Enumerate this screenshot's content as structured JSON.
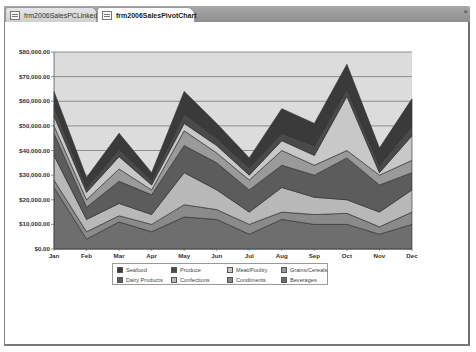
{
  "window": {
    "tabs": [
      {
        "label": "frm2006SalesPCLinked",
        "active": false
      },
      {
        "label": "frm2006SalesPivotChart",
        "active": true
      }
    ],
    "close_label": "×"
  },
  "chart_data": {
    "type": "area",
    "stacked": true,
    "title": "",
    "xlabel": "",
    "ylabel": "",
    "categories": [
      "Jan",
      "Feb",
      "Mar",
      "Apr",
      "May",
      "Jun",
      "Jul",
      "Aug",
      "Sep",
      "Oct",
      "Nov",
      "Dec"
    ],
    "ylim": [
      0,
      80000
    ],
    "yticks": [
      "$80,000.00",
      "$70,000.00",
      "$60,000.00",
      "$50,000.00",
      "$40,000.00",
      "$30,000.00",
      "$20,000.00",
      "$10,000.00",
      "$0.00"
    ],
    "grid": true,
    "legend_position": "bottom",
    "series": [
      {
        "name": "Beverages",
        "color": "#6e6e6e",
        "values": [
          25000,
          4000,
          11000,
          7000,
          13000,
          12000,
          6000,
          12000,
          10000,
          10000,
          6000,
          10000
        ]
      },
      {
        "name": "Condiments",
        "color": "#8a8a8a",
        "values": [
          3000,
          3000,
          2500,
          3000,
          5000,
          4000,
          4000,
          3000,
          4000,
          4500,
          3000,
          5000
        ]
      },
      {
        "name": "Confections",
        "color": "#b8b8b8",
        "values": [
          10000,
          5000,
          5000,
          4000,
          13000,
          8000,
          5000,
          10000,
          7000,
          5500,
          6000,
          9000
        ]
      },
      {
        "name": "Dairy Products",
        "color": "#5c5c5c",
        "values": [
          9000,
          5000,
          9000,
          8000,
          11000,
          11000,
          9000,
          9000,
          9000,
          17000,
          11000,
          7000
        ]
      },
      {
        "name": "Grains/Cereals",
        "color": "#9a9a9a",
        "values": [
          3000,
          3000,
          5000,
          2000,
          6000,
          4000,
          4000,
          6000,
          4000,
          3000,
          4000,
          5000
        ]
      },
      {
        "name": "Meat/Poultry",
        "color": "#c8c8c8",
        "values": [
          4000,
          3000,
          5000,
          2000,
          3000,
          3000,
          2000,
          4000,
          4000,
          22000,
          1000,
          10000
        ]
      },
      {
        "name": "Produce",
        "color": "#4a4a4a",
        "values": [
          4000,
          2000,
          3000,
          2000,
          4000,
          3000,
          3000,
          3000,
          4000,
          3000,
          3000,
          4000
        ]
      },
      {
        "name": "Seafood",
        "color": "#3a3a3a",
        "values": [
          6000,
          4000,
          6500,
          3000,
          9000,
          6000,
          4000,
          10000,
          9000,
          10000,
          7000,
          11000
        ]
      }
    ],
    "plot_background": "#dcdcdc"
  },
  "legend": {
    "items": [
      {
        "label": "Seafood",
        "color": "#3a3a3a"
      },
      {
        "label": "Produce",
        "color": "#4a4a4a"
      },
      {
        "label": "Meat/Poultry",
        "color": "#c8c8c8"
      },
      {
        "label": "Grains/Cereals",
        "color": "#9a9a9a"
      },
      {
        "label": "Dairy Products",
        "color": "#5c5c5c"
      },
      {
        "label": "Confections",
        "color": "#b8b8b8"
      },
      {
        "label": "Condiments",
        "color": "#8a8a8a"
      },
      {
        "label": "Beverages",
        "color": "#6e6e6e"
      }
    ]
  }
}
